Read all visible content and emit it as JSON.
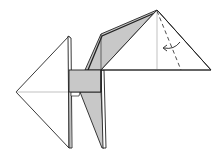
{
  "diagram": {
    "type": "origami-fold-step",
    "colors": {
      "paper_front": "#ffffff",
      "paper_back": "#c8c8c8",
      "line": "#222222",
      "crease": "#888888",
      "background": "#ffffff"
    },
    "elements": [
      {
        "name": "left-triangle-flap",
        "description": "white triangular flap pointing left"
      },
      {
        "name": "center-gray-band",
        "description": "gray rectangular band (reverse side of paper)"
      },
      {
        "name": "upper-gray-flap",
        "description": "gray diagonal flap rising to the peak"
      },
      {
        "name": "right-head-triangle",
        "description": "white triangle on the right with a vertical crease"
      },
      {
        "name": "valley-fold-line",
        "description": "dashed valley fold line from peak to baseline"
      },
      {
        "name": "fold-direction-arrow",
        "description": "curved arrow pointing left indicating fold direction"
      },
      {
        "name": "lower-legs",
        "description": "two narrow leg strips extending downward"
      }
    ]
  }
}
